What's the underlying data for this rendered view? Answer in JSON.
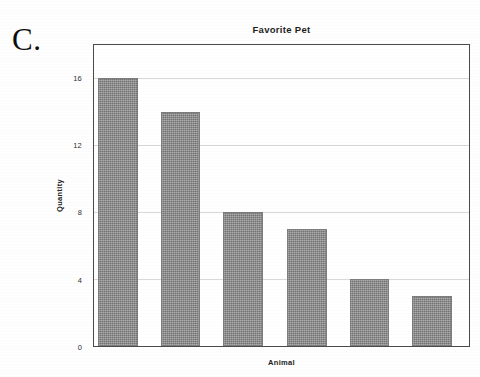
{
  "figure": {
    "label": "C."
  },
  "chart_data": {
    "type": "bar",
    "title": "Favorite Pet",
    "xlabel": "Animal",
    "ylabel": "Quantity",
    "categories": [
      "",
      "",
      "",
      "",
      "",
      ""
    ],
    "values": [
      16,
      14,
      8,
      7,
      4,
      3
    ],
    "ylim": [
      0,
      18
    ],
    "yticks": [
      0,
      4,
      8,
      12,
      16
    ],
    "ytick_labels": [
      "0",
      "4",
      "8",
      "12",
      "16"
    ],
    "xtick_labels": [],
    "grid": true,
    "grid_axis": "y",
    "legend": false,
    "bar_color": "#8d8d8d",
    "frame_color": "#4a4a4a",
    "grid_color": "#d8d8d8"
  }
}
